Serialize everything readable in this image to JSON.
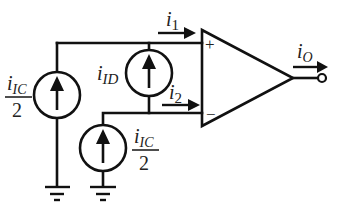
{
  "diagram": {
    "labels": {
      "i1": {
        "base": "i",
        "sub": "1"
      },
      "i2": {
        "base": "i",
        "sub": "2"
      },
      "iO": {
        "base": "i",
        "sub": "O"
      },
      "iID": {
        "base": "i",
        "sub": "ID"
      },
      "iIC_left": {
        "base": "i",
        "sub": "IC",
        "denominator": "2"
      },
      "iIC_bottom": {
        "base": "i",
        "sub": "IC",
        "denominator": "2"
      }
    },
    "opamp": {
      "plus": "+",
      "minus": "−"
    },
    "colors": {
      "stroke": "#111111",
      "background": "#ffffff"
    }
  }
}
